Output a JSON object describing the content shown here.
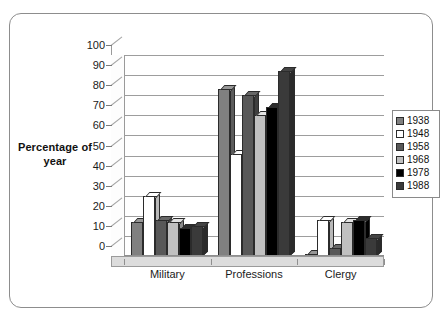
{
  "chart_data": {
    "type": "bar",
    "title": "",
    "subtitle": "",
    "xlabel": "",
    "ylabel": "Percentage of year",
    "ylim": [
      0,
      100
    ],
    "ytick_step": 10,
    "yticks": [
      0,
      10,
      20,
      30,
      40,
      50,
      60,
      70,
      80,
      90,
      100
    ],
    "grid": true,
    "style": "3d-column",
    "legend_position": "right",
    "categories": [
      "Military",
      "Professions",
      "Clergy"
    ],
    "series": [
      {
        "name": "1938",
        "color": "#808080",
        "values": [
          17,
          83,
          1
        ]
      },
      {
        "name": "1948",
        "color": "#ffffff",
        "values": [
          30,
          51,
          18
        ]
      },
      {
        "name": "1958",
        "color": "#585858",
        "values": [
          18,
          80,
          4
        ]
      },
      {
        "name": "1968",
        "color": "#c0c0c0",
        "values": [
          17,
          70,
          17
        ]
      },
      {
        "name": "1978",
        "color": "#000000",
        "values": [
          14,
          74,
          18
        ]
      },
      {
        "name": "1988",
        "color": "#3a3a3a",
        "values": [
          15,
          92,
          9
        ]
      }
    ]
  },
  "legend": {
    "items": [
      {
        "label": "1938"
      },
      {
        "label": "1948"
      },
      {
        "label": "1958"
      },
      {
        "label": "1968"
      },
      {
        "label": "1978"
      },
      {
        "label": "1988"
      }
    ]
  }
}
